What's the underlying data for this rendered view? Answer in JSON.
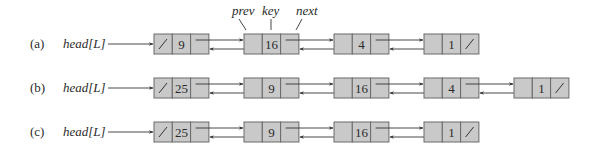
{
  "annotations": {
    "prev": "prev",
    "key": "key",
    "next": "next"
  },
  "rows": [
    {
      "label": "(a)",
      "head": "head[L]",
      "keys": [
        "9",
        "16",
        "4",
        "1"
      ]
    },
    {
      "label": "(b)",
      "head": "head[L]",
      "keys": [
        "25",
        "9",
        "16",
        "4",
        "1"
      ]
    },
    {
      "label": "(c)",
      "head": "head[L]",
      "keys": [
        "25",
        "9",
        "16",
        "1"
      ]
    }
  ],
  "colors": {
    "node_fill": "#c9c9c9",
    "node_border": "#6a6a6a",
    "line": "#333333"
  }
}
